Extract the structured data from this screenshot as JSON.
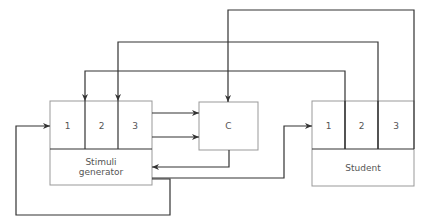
{
  "stimuli_generator": {
    "cells": [
      "1",
      "2",
      "3"
    ],
    "label": "Stimuli generator"
  },
  "comparator": {
    "label": "C"
  },
  "student": {
    "cells": [
      "1",
      "2",
      "3"
    ],
    "label": "Student"
  },
  "colors": {
    "line": "#333333",
    "box": "#999999"
  }
}
